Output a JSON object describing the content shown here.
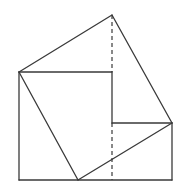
{
  "diagram": {
    "title": "",
    "stroke_color": "#3a3a3a",
    "background": "#ffffff",
    "points": {
      "A": [
        19,
        72
      ],
      "B": [
        112,
        15
      ],
      "C": [
        172,
        123
      ],
      "D": [
        78,
        180
      ],
      "E": [
        112,
        72
      ],
      "F": [
        112,
        123
      ],
      "G": [
        19,
        180
      ],
      "H": [
        172,
        180
      ],
      "I": [
        112,
        180
      ]
    },
    "solid_segments": [
      [
        "A",
        "B"
      ],
      [
        "B",
        "C"
      ],
      [
        "C",
        "D"
      ],
      [
        "D",
        "A"
      ],
      [
        "A",
        "E"
      ],
      [
        "E",
        "F"
      ],
      [
        "F",
        "C"
      ],
      [
        "A",
        "G"
      ],
      [
        "G",
        "H"
      ],
      [
        "H",
        "C"
      ]
    ],
    "dashed_segments": [
      [
        "B",
        "E"
      ],
      [
        "F",
        "I"
      ]
    ]
  }
}
